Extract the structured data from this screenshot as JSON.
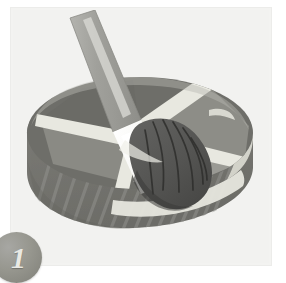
{
  "illustration": {
    "title": "Step 1 illustration: brush applying coating to a ribbed wheel",
    "step_badge": {
      "label": "1",
      "shape": "circle",
      "fill_color": "#8f8f88",
      "text_color": "#e9e9e4",
      "position": "bottom-left"
    },
    "canvas": {
      "background_color": "#f2f2f0",
      "frame_color": "#ececea",
      "width": 286,
      "height": 275
    },
    "objects": [
      {
        "name": "paintbrush",
        "parts": [
          {
            "name": "handle",
            "color": "#9d9d99",
            "highlight_color": "#d6d6d2"
          },
          {
            "name": "ferrule",
            "color": "#fbfbf9",
            "shade_color": "#e3e3df"
          },
          {
            "name": "bristles",
            "color": "#5a5a56",
            "stroke_color": "#2f2f2d"
          }
        ]
      },
      {
        "name": "ribbed-wheel",
        "parts": [
          {
            "name": "outer-rim",
            "color": "#777772",
            "rib_color": "#8c8c87"
          },
          {
            "name": "rim-top-face",
            "color": "#6e6e69"
          },
          {
            "name": "rim-lip",
            "color": "#e6e6de"
          },
          {
            "name": "spokes",
            "color": "#e8e8e0"
          },
          {
            "name": "sectors",
            "color": "#8b8b85"
          },
          {
            "name": "hub",
            "color": "#dedcd2"
          }
        ]
      }
    ],
    "icon_names": [
      "paintbrush-icon",
      "wheel-icon",
      "step-number-badge"
    ]
  }
}
